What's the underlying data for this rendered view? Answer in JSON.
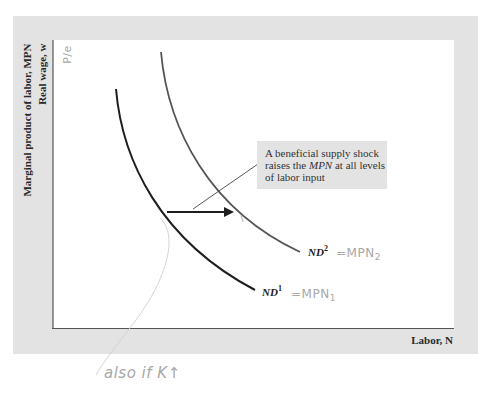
{
  "diagram": {
    "y_axis_label_line1": "Marginal product of labor, MPN",
    "y_axis_label_line2": "Real wage, w",
    "x_axis_label": "Labor, N",
    "callout_text_part1": "A beneficial supply shock raises the ",
    "callout_text_em": "MPN",
    "callout_text_part2": " at all levels of labor input",
    "curves": [
      {
        "id": "ND1",
        "label_main": "ND",
        "label_sup": "1",
        "annotation": "=MPN",
        "annotation_sub": "1"
      },
      {
        "id": "ND2",
        "label_main": "ND",
        "label_sup": "2",
        "annotation": "=MPN",
        "annotation_sub": "2"
      }
    ],
    "shift_arrow": "rightward",
    "handwritten": {
      "y_axis_note": "P/e",
      "bottom_note": "also if K↑"
    },
    "colors": {
      "frame": "#e3e3e3",
      "plot": "#ffffff",
      "nd1": "#1e1e1e",
      "nd2": "#555555",
      "handwriting": "#a8a8a8"
    }
  }
}
